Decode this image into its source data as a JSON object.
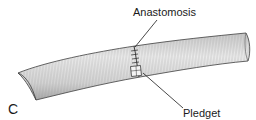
{
  "figure": {
    "panel_letter": "C",
    "labels": {
      "anastomosis": "Anastomosis",
      "pledget": "Pledget"
    },
    "colors": {
      "vessel_fill": "#d9d9d9",
      "vessel_outline": "#3a3a3a",
      "hatching": "#8a8a8a",
      "text": "#1a1a1a",
      "leader_line": "#1a1a1a"
    }
  }
}
